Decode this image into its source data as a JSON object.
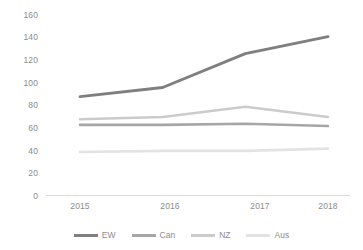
{
  "chart_data": {
    "type": "line",
    "title": "",
    "subtitle": "",
    "xlabel": "",
    "ylabel": "",
    "categories": [
      "2015",
      "2016",
      "2017",
      "2018"
    ],
    "x_tick_labels": [
      "2015",
      "2016",
      "2017",
      "2018"
    ],
    "y_tick_labels": [
      "0",
      "20",
      "40",
      "60",
      "80",
      "100",
      "120",
      "140",
      "160"
    ],
    "y_ticks": [
      0,
      20,
      40,
      60,
      80,
      100,
      120,
      140,
      160
    ],
    "ylim": [
      0,
      160
    ],
    "grid": false,
    "legend_position": "bottom",
    "series": [
      {
        "name": "EW",
        "color": "#7f7f7f",
        "values": [
          87,
          95,
          125,
          140
        ]
      },
      {
        "name": "Can",
        "color": "#a6a6a6",
        "values": [
          62,
          62,
          63,
          61
        ]
      },
      {
        "name": "NZ",
        "color": "#cbcbcb",
        "values": [
          67,
          69,
          78,
          69
        ]
      },
      {
        "name": "Aus",
        "color": "#e3e3e3",
        "values": [
          38,
          39,
          39,
          41
        ]
      }
    ]
  },
  "axis": {
    "baseline_color": "#d9d9d9",
    "tick_text_color": "#8c8c8c"
  },
  "legend": {
    "items": [
      {
        "label": "EW",
        "color": "#7f7f7f"
      },
      {
        "label": "Can",
        "color": "#a6a6a6"
      },
      {
        "label": "NZ",
        "color": "#cbcbcb"
      },
      {
        "label": "Aus",
        "color": "#e3e3e3"
      }
    ]
  }
}
